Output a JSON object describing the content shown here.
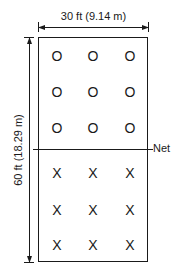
{
  "diagram": {
    "width_label": "30 ft (9.14 m)",
    "length_label": "60 ft (18.29 m)",
    "net_label": "Net",
    "colors": {
      "line": "#1a1a1a",
      "background": "#ffffff"
    },
    "team_top": {
      "symbol": "O",
      "players": [
        {
          "row": 1,
          "col": 1,
          "symbol": "O"
        },
        {
          "row": 1,
          "col": 2,
          "symbol": "O"
        },
        {
          "row": 1,
          "col": 3,
          "symbol": "O"
        },
        {
          "row": 2,
          "col": 1,
          "symbol": "O"
        },
        {
          "row": 2,
          "col": 2,
          "symbol": "O"
        },
        {
          "row": 2,
          "col": 3,
          "symbol": "O"
        },
        {
          "row": 3,
          "col": 1,
          "symbol": "O"
        },
        {
          "row": 3,
          "col": 2,
          "symbol": "O"
        },
        {
          "row": 3,
          "col": 3,
          "symbol": "O"
        }
      ]
    },
    "team_bottom": {
      "symbol": "X",
      "players": [
        {
          "row": 1,
          "col": 1,
          "symbol": "X"
        },
        {
          "row": 1,
          "col": 2,
          "symbol": "X"
        },
        {
          "row": 1,
          "col": 3,
          "symbol": "X"
        },
        {
          "row": 2,
          "col": 1,
          "symbol": "X"
        },
        {
          "row": 2,
          "col": 2,
          "symbol": "X"
        },
        {
          "row": 2,
          "col": 3,
          "symbol": "X"
        },
        {
          "row": 3,
          "col": 1,
          "symbol": "X"
        },
        {
          "row": 3,
          "col": 2,
          "symbol": "X"
        },
        {
          "row": 3,
          "col": 3,
          "symbol": "X"
        }
      ]
    }
  }
}
